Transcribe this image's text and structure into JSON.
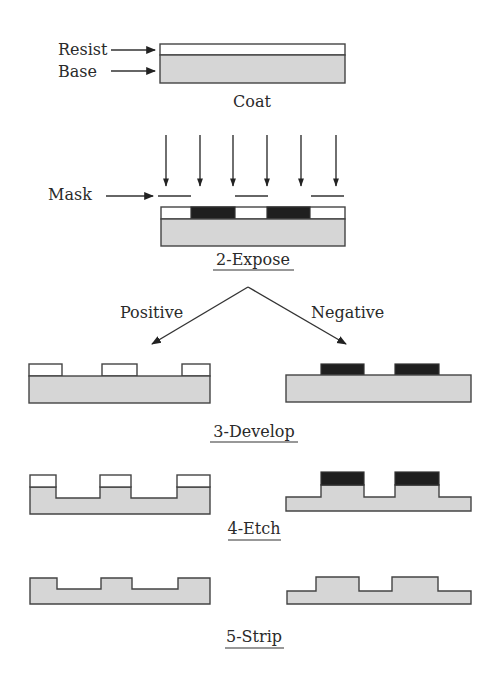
{
  "diagram": {
    "colors": {
      "base": "#d6d6d6",
      "resist_unexposed": "#ffffff",
      "resist_exposed": "#1f1f1f",
      "outline": "#444444"
    },
    "labels": {
      "resist": "Resist",
      "base": "Base",
      "mask": "Mask",
      "positive": "Positive",
      "negative": "Negative"
    },
    "steps": [
      {
        "id": "coat",
        "caption": "Coat",
        "underlined": false
      },
      {
        "id": "expose",
        "caption": "2-Expose",
        "underlined": true
      },
      {
        "id": "develop",
        "caption": "3-Develop",
        "underlined": true
      },
      {
        "id": "etch",
        "caption": "4-Etch",
        "underlined": true
      },
      {
        "id": "strip",
        "caption": "5-Strip",
        "underlined": true
      }
    ],
    "branches": [
      "Positive",
      "Negative"
    ],
    "light_arrows_count": 6,
    "mask_segments_count": 3
  }
}
